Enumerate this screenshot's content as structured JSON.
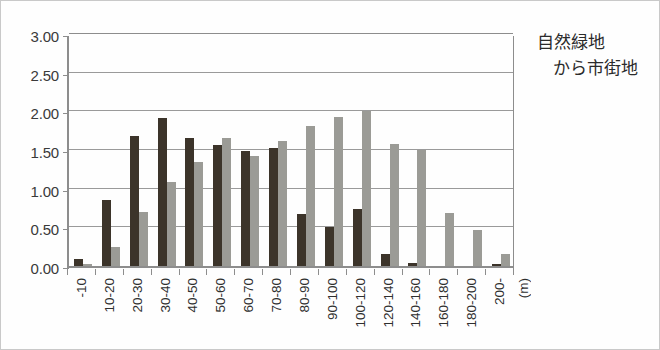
{
  "annotation": {
    "line1": "自然緑地",
    "line2": "から市街地"
  },
  "axis": {
    "x_unit": "(m)",
    "y_ticks": [
      "0.00",
      "0.50",
      "1.00",
      "1.50",
      "2.00",
      "2.50",
      "3.00"
    ]
  },
  "chart_data": {
    "type": "bar",
    "title": "",
    "subtitle": "",
    "xlabel": "(m)",
    "ylabel": "",
    "ylim": [
      0,
      3.0
    ],
    "ytick_values": [
      0.0,
      0.5,
      1.0,
      1.5,
      2.0,
      2.5,
      3.0
    ],
    "ytick_labels": [
      "0.00",
      "0.50",
      "1.00",
      "1.50",
      "2.00",
      "2.50",
      "3.00"
    ],
    "grid": true,
    "legend": false,
    "legend_position": "none",
    "annotations": [
      "自然緑地",
      "から市街地"
    ],
    "categories": [
      "-10",
      "10-20",
      "20-30",
      "30-40",
      "40-50",
      "50-60",
      "60-70",
      "70-80",
      "80-90",
      "90-100",
      "100-120",
      "120-140",
      "140-160",
      "160-180",
      "180-200",
      "200-"
    ],
    "series": [
      {
        "name": "dark",
        "color": "#3c342a",
        "values": [
          0.09,
          0.85,
          1.68,
          1.91,
          1.66,
          1.57,
          1.49,
          1.53,
          0.67,
          0.51,
          0.74,
          0.16,
          0.04,
          0.0,
          0.0,
          0.03
        ]
      },
      {
        "name": "light",
        "color": "#9b9b96",
        "values": [
          0.02,
          0.25,
          0.7,
          1.09,
          1.34,
          1.66,
          1.42,
          1.62,
          1.81,
          1.93,
          2.0,
          1.58,
          1.5,
          0.68,
          0.46,
          0.16
        ]
      }
    ]
  }
}
